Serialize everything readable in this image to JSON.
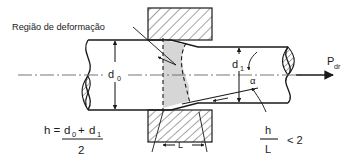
{
  "figure": {
    "annotations": {
      "region_label": "Região de deformação",
      "diameter_initial": "d",
      "diameter_initial_sub": "0",
      "diameter_final": "d",
      "diameter_final_sub": "1",
      "angle": "α",
      "contact_length": "L",
      "force": "P",
      "force_sub": "dr"
    },
    "equations": {
      "mean_thickness_lhs": "h =",
      "mean_thickness_numerator_a": "d",
      "mean_thickness_numerator_a_sub": "0",
      "mean_thickness_plus": "+",
      "mean_thickness_numerator_b": "d",
      "mean_thickness_numerator_b_sub": "1",
      "mean_thickness_denominator": "2",
      "ratio_numerator": "h",
      "ratio_denominator": "L",
      "ratio_comparison": "< 2"
    },
    "colors": {
      "line": "#1a1a1a",
      "deformation_fill": "#d6d6d6",
      "hatch": "#333333",
      "centerline": "#555555",
      "background": "#ffffff"
    }
  }
}
